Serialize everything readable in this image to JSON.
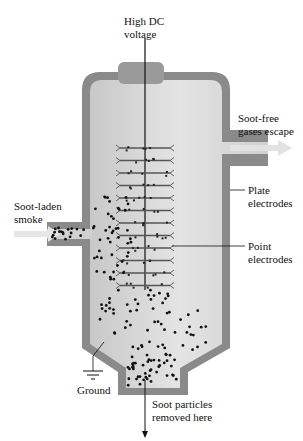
{
  "labels": {
    "high_dc": [
      "High DC",
      "voltage"
    ],
    "soot_free": [
      "Soot-free",
      "gases escape"
    ],
    "plate": [
      "Plate",
      "electrodes"
    ],
    "point": [
      "Point",
      "electrodes"
    ],
    "soot_laden": [
      "Soot-laden",
      "smoke"
    ],
    "ground": "Ground",
    "removed": [
      "Soot particles",
      "removed here"
    ]
  },
  "colors": {
    "wall": "#8a8a8a",
    "interior": "#d4d4d4",
    "interior_light": "#e6e6e6",
    "arrow": "#dcdcdc",
    "electrode": "#555555",
    "particle": "#111111",
    "line": "#111111"
  },
  "electrode_rows": 12
}
